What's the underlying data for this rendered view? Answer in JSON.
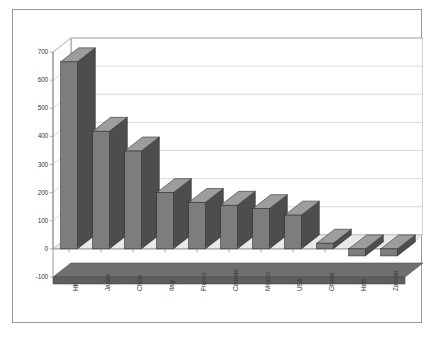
{
  "chart_data": {
    "type": "bar",
    "title": "",
    "xlabel": "",
    "ylabel": "",
    "ylim": [
      -100,
      700
    ],
    "ytick_step": 100,
    "yticks": [
      700,
      600,
      500,
      400,
      300,
      200,
      100,
      0,
      -100
    ],
    "grid": true,
    "legend": "none",
    "style": "3d-column",
    "categories": [
      "HK",
      "Japan",
      "China",
      "Italy",
      "France",
      "Canada",
      "Mexico",
      "USA",
      "Ghana",
      "Haiti",
      "Zambia"
    ],
    "values": [
      665,
      418,
      348,
      200,
      165,
      155,
      143,
      120,
      20,
      -25,
      -25
    ],
    "series": [
      {
        "name": "Series 1",
        "values": [
          665,
          418,
          348,
          200,
          165,
          155,
          143,
          120,
          20,
          -25,
          -25
        ]
      }
    ]
  },
  "colors": {
    "bar_front": "#7d7d7d",
    "bar_side": "#4d4d4d",
    "bar_top": "#9d9d9d",
    "floor": "#707070",
    "gridline": "#c9c9c9",
    "axis": "#808080",
    "frame_border": "#9a9a9a",
    "text": "#3a3a3a",
    "plot_background": "#ffffff"
  }
}
